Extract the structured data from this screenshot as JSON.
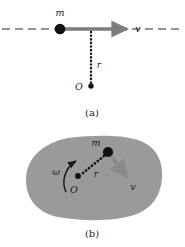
{
  "figure": {
    "panels": [
      {
        "id": "a",
        "caption": "(a)",
        "caption_x": 92,
        "caption_y": 113,
        "description": "Particle of mass m moving in a straight line with velocity v; perpendicular distance r from origin O.",
        "labels": {
          "mass": "m",
          "velocity": "v",
          "radius": "r",
          "origin": "O"
        },
        "label_positions": {
          "mass": {
            "x": 60,
            "y": 16
          },
          "velocity": {
            "x": 138,
            "y": 32
          },
          "radius": {
            "x": 98,
            "y": 66
          },
          "origin": {
            "x": 78,
            "y": 90
          }
        },
        "geometry": {
          "particle": {
            "x": 60,
            "y": 29,
            "r": 5.2
          },
          "origin_dot": {
            "x": 91,
            "y": 86,
            "r": 2.6
          },
          "velocity_arrow": {
            "x1": 60,
            "y1": 29,
            "x2": 131,
            "y2": 29
          },
          "dashed_line": {
            "x1": 2,
            "y1": 29,
            "x2": 183,
            "y2": 29
          },
          "dotted_radius": {
            "x1": 91,
            "y1": 31,
            "x2": 91,
            "y2": 84
          }
        }
      },
      {
        "id": "b",
        "caption": "(b)",
        "caption_x": 92,
        "caption_y": 234,
        "description": "Rigid body rotating with angular velocity omega about axis through O; mass element m at distance r moves with tangential velocity v.",
        "labels": {
          "angular_velocity": "ω",
          "mass": "m",
          "velocity": "v",
          "radius": "r",
          "origin": "O"
        },
        "label_positions": {
          "angular_velocity": {
            "x": 56,
            "y": 173
          },
          "mass": {
            "x": 95,
            "y": 146
          },
          "velocity": {
            "x": 132,
            "y": 189
          },
          "radius": {
            "x": 95,
            "y": 175
          },
          "origin": {
            "x": 73,
            "y": 191
          }
        },
        "geometry": {
          "center_dot": {
            "x": 78,
            "y": 176,
            "r": 2.8
          },
          "mass_dot": {
            "x": 109,
            "y": 152,
            "r": 5.0
          },
          "velocity_arrow": {
            "x1": 111,
            "y1": 155,
            "x2": 131,
            "y2": 181
          },
          "dotted_radius": {
            "x1": 82,
            "y1": 174,
            "x2": 105,
            "y2": 155
          },
          "omega_arc": "M 66 190 C 62 180, 66 168, 76 162",
          "blob_fill": "#9a9a9a"
        }
      }
    ],
    "colors": {
      "ink": "#1a1a1a",
      "arrow_gray": "#7d7d7d",
      "blob_gray": "#9a9a9a",
      "background": "#ffffff"
    }
  }
}
